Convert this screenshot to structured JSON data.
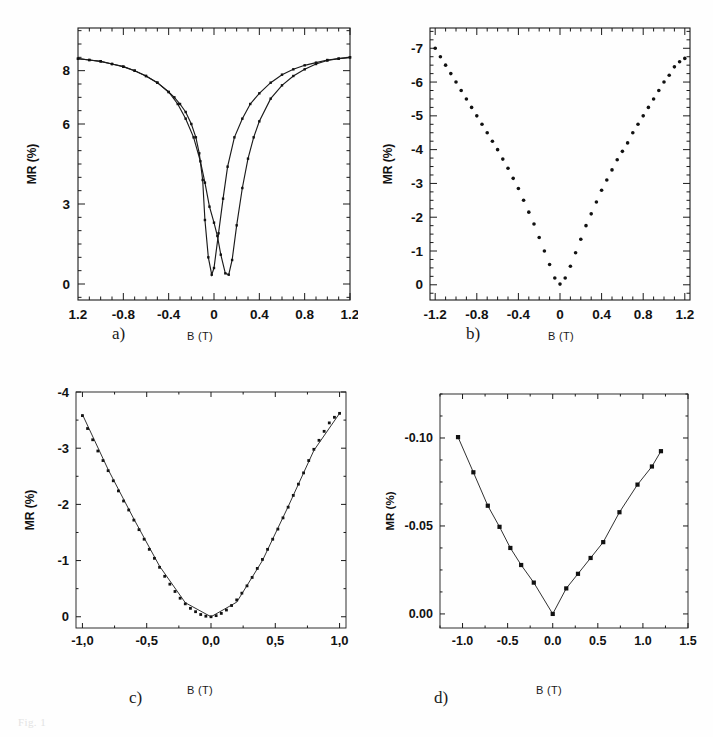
{
  "figure": {
    "panels": [
      "a)",
      "b)",
      "c)",
      "d)"
    ],
    "caption_fragment": "Fig. 1"
  },
  "panel_a": {
    "letter": "a)",
    "xlabel": "B (T)",
    "ylabel": "MR (%)",
    "xticks": [
      "1.2",
      "-0.8",
      "-0.4",
      "0",
      "0.4",
      "0.8",
      "1.2"
    ],
    "yticks": [
      "0",
      "3",
      "6",
      "8"
    ]
  },
  "panel_b": {
    "letter": "b)",
    "xlabel": "B (T)",
    "ylabel": "MR (%)",
    "xticks": [
      "-1.2",
      "-0.8",
      "-0.4",
      "0",
      "0.4",
      "0.8",
      "1.2"
    ],
    "yticks": [
      "0",
      "-1",
      "-2",
      "-3",
      "-4",
      "-5",
      "-6",
      "-7"
    ]
  },
  "panel_c": {
    "letter": "c)",
    "xlabel": "B (T)",
    "ylabel": "MR (%)",
    "xticks": [
      "-1,0",
      "-0,5",
      "0,0",
      "0,5",
      "1,0"
    ],
    "yticks": [
      "0",
      "-1",
      "-2",
      "-3",
      "-4"
    ]
  },
  "panel_d": {
    "letter": "d)",
    "xlabel": "B (T)",
    "ylabel": "MR (%)",
    "xticks": [
      "-1.0",
      "-0.5",
      "0.0",
      "0.5",
      "1.0",
      "1.5"
    ],
    "yticks": [
      "0.00",
      "-0.05",
      "-0.10"
    ]
  },
  "chart_data": [
    {
      "id": "a",
      "type": "line",
      "title": "a)",
      "xlabel": "B (T)",
      "ylabel": "MR (%)",
      "xlim": [
        -1.2,
        1.2
      ],
      "ylim": [
        9.6,
        -0.6
      ],
      "y_axis_inverted": true,
      "xticks": [
        -1.2,
        -0.8,
        -0.4,
        0,
        0.4,
        0.8,
        1.2
      ],
      "xtick_labels": [
        "1.2",
        "-0.8",
        "-0.4",
        "0",
        "0.4",
        "0.8",
        "1.2"
      ],
      "yticks": [
        0,
        3,
        6,
        8
      ],
      "ytick_labels": [
        "0",
        "3",
        "6",
        "8"
      ],
      "grid": false,
      "legend": "none",
      "note": "Hysteretic magnetoresistance; two branches peaking near B = -0.08 T and +0.10 T",
      "series": [
        {
          "name": "decreasing-field branch",
          "marker": "square",
          "x": [
            -1.2,
            -1.1,
            -1.0,
            -0.9,
            -0.8,
            -0.7,
            -0.6,
            -0.5,
            -0.4,
            -0.35,
            -0.3,
            -0.25,
            -0.2,
            -0.16,
            -0.13,
            -0.1,
            -0.08,
            -0.05,
            -0.02,
            0.0,
            0.04,
            0.08,
            0.12,
            0.18,
            0.25,
            0.32,
            0.4,
            0.5,
            0.6,
            0.7,
            0.8,
            0.9,
            1.0,
            1.1,
            1.2
          ],
          "y": [
            8.45,
            8.4,
            8.35,
            8.25,
            8.15,
            8.0,
            7.8,
            7.55,
            7.2,
            7.0,
            6.75,
            6.45,
            6.0,
            5.5,
            4.9,
            3.9,
            2.4,
            1.0,
            0.35,
            0.6,
            1.9,
            3.2,
            4.4,
            5.5,
            6.2,
            6.75,
            7.15,
            7.55,
            7.85,
            8.05,
            8.2,
            8.3,
            8.4,
            8.45,
            8.5
          ]
        },
        {
          "name": "increasing-field branch",
          "marker": "square",
          "x": [
            -1.2,
            -1.1,
            -1.0,
            -0.9,
            -0.8,
            -0.7,
            -0.6,
            -0.5,
            -0.4,
            -0.32,
            -0.25,
            -0.18,
            -0.12,
            -0.08,
            -0.04,
            0.0,
            0.03,
            0.06,
            0.1,
            0.13,
            0.16,
            0.2,
            0.25,
            0.3,
            0.35,
            0.4,
            0.5,
            0.6,
            0.7,
            0.8,
            0.9,
            1.0,
            1.1,
            1.2
          ],
          "y": [
            8.45,
            8.4,
            8.35,
            8.25,
            8.15,
            8.0,
            7.8,
            7.55,
            7.2,
            6.75,
            6.2,
            5.5,
            4.6,
            3.8,
            2.9,
            2.3,
            1.8,
            1.1,
            0.4,
            0.35,
            0.9,
            2.2,
            3.6,
            4.7,
            5.5,
            6.1,
            6.95,
            7.45,
            7.8,
            8.05,
            8.25,
            8.38,
            8.45,
            8.5
          ]
        }
      ]
    },
    {
      "id": "b",
      "type": "scatter",
      "title": "b)",
      "xlabel": "B (T)",
      "ylabel": "MR (%)",
      "xlim": [
        -1.25,
        1.25
      ],
      "ylim": [
        -7.6,
        0.45
      ],
      "xticks": [
        -1.2,
        -0.8,
        -0.4,
        0,
        0.4,
        0.8,
        1.2
      ],
      "xtick_labels": [
        "-1.2",
        "-0.8",
        "-0.4",
        "0",
        "0.4",
        "0.8",
        "1.2"
      ],
      "yticks": [
        0,
        -1,
        -2,
        -3,
        -4,
        -5,
        -6,
        -7
      ],
      "ytick_labels": [
        "0",
        "-1",
        "-2",
        "-3",
        "-4",
        "-5",
        "-6",
        "-7"
      ],
      "grid": false,
      "legend": "none",
      "note": "Sharp cusp at B = 0, nearly linear negative MR wings down to about -7%",
      "series": [
        {
          "name": "MR",
          "marker": "dot",
          "x": [
            -1.2,
            -1.15,
            -1.1,
            -1.05,
            -1.0,
            -0.95,
            -0.9,
            -0.85,
            -0.8,
            -0.75,
            -0.7,
            -0.65,
            -0.6,
            -0.55,
            -0.5,
            -0.45,
            -0.4,
            -0.35,
            -0.3,
            -0.25,
            -0.2,
            -0.15,
            -0.1,
            -0.05,
            0.0,
            0.05,
            0.1,
            0.15,
            0.2,
            0.25,
            0.3,
            0.35,
            0.4,
            0.45,
            0.5,
            0.55,
            0.6,
            0.65,
            0.7,
            0.75,
            0.8,
            0.85,
            0.9,
            0.95,
            1.0,
            1.05,
            1.1,
            1.15,
            1.2
          ],
          "y": [
            -7.0,
            -6.75,
            -6.5,
            -6.25,
            -6.0,
            -5.75,
            -5.5,
            -5.25,
            -5.0,
            -4.75,
            -4.5,
            -4.25,
            -4.0,
            -3.72,
            -3.45,
            -3.15,
            -2.85,
            -2.5,
            -2.15,
            -1.8,
            -1.4,
            -1.0,
            -0.6,
            -0.2,
            -0.02,
            -0.2,
            -0.55,
            -0.95,
            -1.35,
            -1.75,
            -2.1,
            -2.45,
            -2.8,
            -3.1,
            -3.4,
            -3.7,
            -3.95,
            -4.2,
            -4.5,
            -4.75,
            -5.0,
            -5.25,
            -5.5,
            -5.75,
            -6.0,
            -6.2,
            -6.45,
            -6.6,
            -6.7
          ]
        }
      ]
    },
    {
      "id": "c",
      "type": "scatter",
      "title": "c)",
      "xlabel": "B (T)",
      "ylabel": "MR (%)",
      "xlim": [
        -1.05,
        1.05
      ],
      "ylim": [
        -4.0,
        0.2
      ],
      "xticks": [
        -1.0,
        -0.5,
        0.0,
        0.5,
        1.0
      ],
      "xtick_labels": [
        "-1,0",
        "-0,5",
        "0,0",
        "0,5",
        "1,0"
      ],
      "yticks": [
        0,
        -1,
        -2,
        -3,
        -4
      ],
      "ytick_labels": [
        "0",
        "-1",
        "-2",
        "-3",
        "-4"
      ],
      "grid": false,
      "legend": "none",
      "note": "Smooth parabolic negative MR with fitted solid line; minimum near -3.6% at +/-1.0 T",
      "series": [
        {
          "name": "MR data",
          "marker": "square",
          "x": [
            -1.0,
            -0.96,
            -0.92,
            -0.88,
            -0.84,
            -0.8,
            -0.76,
            -0.72,
            -0.68,
            -0.64,
            -0.6,
            -0.56,
            -0.52,
            -0.48,
            -0.44,
            -0.4,
            -0.36,
            -0.32,
            -0.28,
            -0.24,
            -0.2,
            -0.16,
            -0.12,
            -0.08,
            -0.04,
            0.0,
            0.04,
            0.08,
            0.12,
            0.16,
            0.2,
            0.24,
            0.28,
            0.32,
            0.36,
            0.4,
            0.44,
            0.48,
            0.52,
            0.56,
            0.6,
            0.64,
            0.68,
            0.72,
            0.76,
            0.8,
            0.84,
            0.88,
            0.92,
            0.96,
            1.0
          ],
          "y": [
            -3.58,
            -3.35,
            -3.15,
            -2.95,
            -2.78,
            -2.6,
            -2.42,
            -2.24,
            -2.06,
            -1.9,
            -1.72,
            -1.55,
            -1.38,
            -1.2,
            -1.04,
            -0.88,
            -0.72,
            -0.58,
            -0.45,
            -0.33,
            -0.23,
            -0.15,
            -0.09,
            -0.04,
            -0.01,
            0.0,
            -0.02,
            -0.06,
            -0.12,
            -0.2,
            -0.3,
            -0.42,
            -0.55,
            -0.7,
            -0.86,
            -1.02,
            -1.2,
            -1.38,
            -1.56,
            -1.76,
            -1.95,
            -2.16,
            -2.36,
            -2.56,
            -2.78,
            -2.98,
            -3.14,
            -3.3,
            -3.45,
            -3.55,
            -3.62
          ]
        },
        {
          "name": "fit",
          "marker": "line",
          "x": [
            -1.0,
            -0.8,
            -0.6,
            -0.4,
            -0.2,
            0.0,
            0.2,
            0.4,
            0.6,
            0.8,
            1.0
          ],
          "y": [
            -3.6,
            -2.62,
            -1.74,
            -0.9,
            -0.25,
            0.0,
            -0.26,
            -1.0,
            -1.96,
            -2.96,
            -3.62
          ]
        }
      ]
    },
    {
      "id": "d",
      "type": "line",
      "title": "d)",
      "xlabel": "B (T)",
      "ylabel": "MR (%)",
      "xlim": [
        -1.25,
        1.5
      ],
      "ylim": [
        -0.125,
        0.008
      ],
      "xticks": [
        -1.0,
        -0.5,
        0.0,
        0.5,
        1.0,
        1.5
      ],
      "xtick_labels": [
        "-1.0",
        "-0.5",
        "0.0",
        "0.5",
        "1.0",
        "1.5"
      ],
      "yticks": [
        0.0,
        -0.05,
        -0.1
      ],
      "ytick_labels": [
        "0.00",
        "-0.05",
        "-0.10"
      ],
      "grid": false,
      "legend": "none",
      "note": "Small negative MR, peak at B = 0, reaching about -0.10% at -1.05 T and -0.093% at +1.2 T",
      "series": [
        {
          "name": "MR",
          "marker": "square",
          "x": [
            -1.05,
            -0.88,
            -0.72,
            -0.59,
            -0.47,
            -0.35,
            -0.21,
            0.0,
            0.15,
            0.28,
            0.42,
            0.56,
            0.74,
            0.94,
            1.1,
            1.2
          ],
          "y": [
            -0.1005,
            -0.0805,
            -0.0615,
            -0.0495,
            -0.0375,
            -0.0278,
            -0.0178,
            0.0,
            -0.0145,
            -0.0228,
            -0.0318,
            -0.0408,
            -0.0578,
            -0.0735,
            -0.0838,
            -0.0925
          ]
        }
      ]
    }
  ]
}
